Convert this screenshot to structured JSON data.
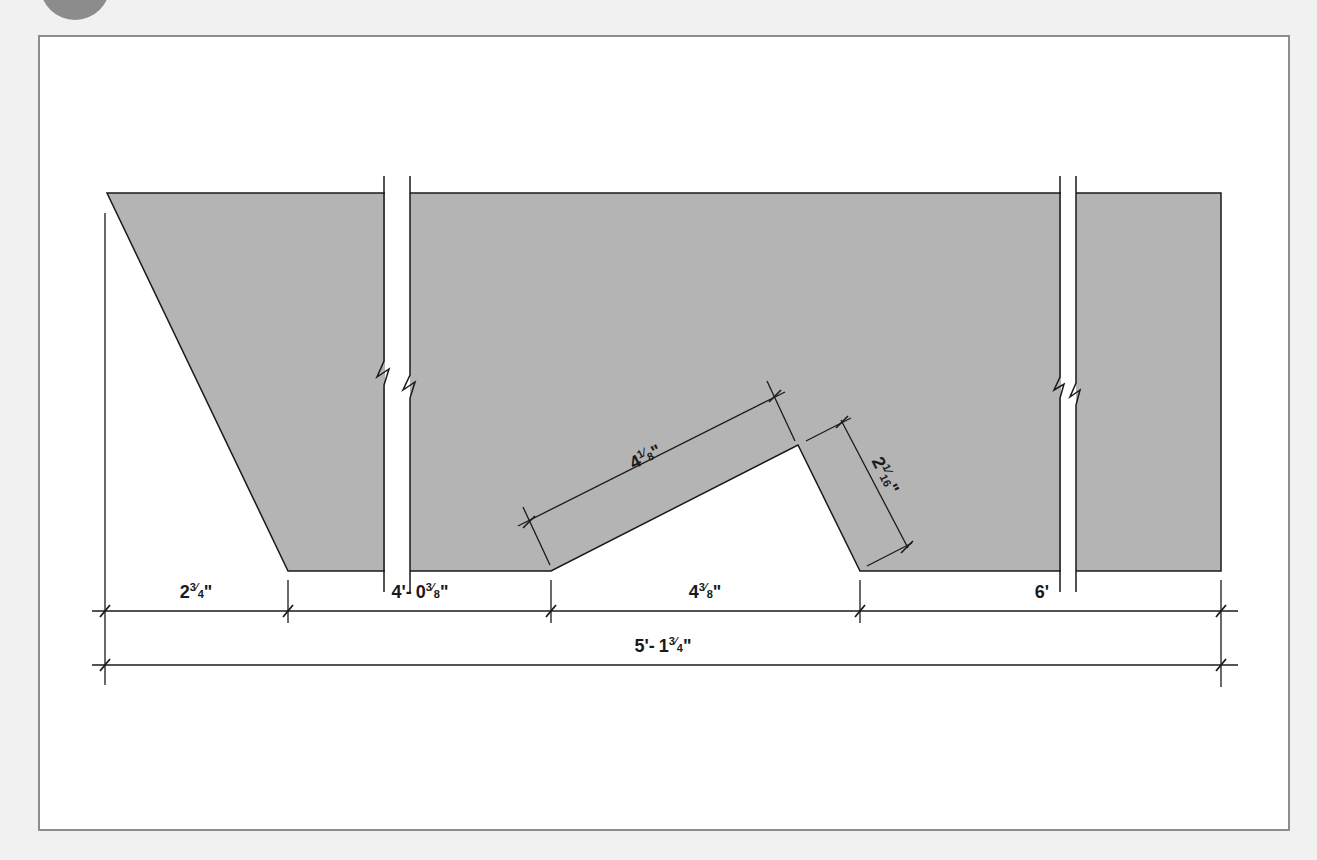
{
  "figure": {
    "type": "dimensioned-shape-drawing",
    "colors": {
      "page_background": "#f1f1f1",
      "frame_border": "#8d8d8d",
      "shape_fill": "#b4b4b4",
      "line": "#1a1a1a",
      "badge": "#8c8c8c"
    }
  },
  "dimensions": {
    "segment_1": {
      "whole": "2",
      "num": "3",
      "den": "4",
      "unit": "\""
    },
    "segment_2": {
      "feet": "4'-",
      "whole": "0",
      "num": "3",
      "den": "8",
      "unit": "\""
    },
    "segment_3": {
      "whole": "4",
      "num": "3",
      "den": "8",
      "unit": "\""
    },
    "segment_4": {
      "label": "6'"
    },
    "overall": {
      "feet": "5'-",
      "whole": "1",
      "num": "3",
      "den": "4",
      "unit": "\""
    },
    "notch_long_side": {
      "whole": "4",
      "num": "1",
      "den": "8",
      "unit": "\""
    },
    "notch_short_side": {
      "whole": "2",
      "num": "1",
      "den": "16",
      "unit": "\""
    }
  },
  "break_marks": [
    {
      "name": "left-break",
      "x": 397
    },
    {
      "name": "right-break",
      "x": 1068
    }
  ]
}
